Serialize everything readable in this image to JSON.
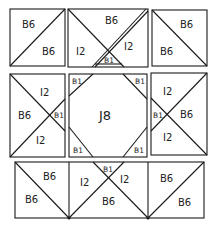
{
  "diagram": {
    "type": "quilt-block-layout",
    "rows": [
      {
        "name": "top-row",
        "blocks": [
          {
            "name": "top-left",
            "pieces": [
              {
                "label": "B6",
                "pos": "upper-left"
              },
              {
                "label": "B6",
                "pos": "lower-right"
              }
            ]
          },
          {
            "name": "top-center",
            "pieces": [
              {
                "label": "B6",
                "pos": "top"
              },
              {
                "label": "I2",
                "pos": "left"
              },
              {
                "label": "I2",
                "pos": "right"
              },
              {
                "label": "B1",
                "pos": "bottom"
              }
            ]
          },
          {
            "name": "top-right",
            "pieces": [
              {
                "label": "B6",
                "pos": "upper-right"
              },
              {
                "label": "B6",
                "pos": "lower-left"
              }
            ]
          }
        ]
      },
      {
        "name": "middle-row",
        "blocks": [
          {
            "name": "middle-left",
            "pieces": [
              {
                "label": "I2",
                "pos": "top"
              },
              {
                "label": "B6",
                "pos": "left"
              },
              {
                "label": "B1",
                "pos": "right"
              },
              {
                "label": "I2",
                "pos": "bottom"
              }
            ]
          },
          {
            "name": "center",
            "pieces": [
              {
                "label": "B1",
                "pos": "top-left"
              },
              {
                "label": "B1",
                "pos": "top-right"
              },
              {
                "label": "J8",
                "pos": "center"
              },
              {
                "label": "B1",
                "pos": "bottom-left"
              },
              {
                "label": "B1",
                "pos": "bottom-right"
              }
            ]
          },
          {
            "name": "middle-right",
            "pieces": [
              {
                "label": "I2",
                "pos": "top"
              },
              {
                "label": "B1",
                "pos": "left"
              },
              {
                "label": "B6",
                "pos": "right"
              },
              {
                "label": "I2",
                "pos": "bottom"
              }
            ]
          }
        ]
      },
      {
        "name": "bottom-row",
        "blocks": [
          {
            "name": "bottom-left",
            "pieces": [
              {
                "label": "B6",
                "pos": "upper-right"
              },
              {
                "label": "B6",
                "pos": "lower-left"
              }
            ]
          },
          {
            "name": "bottom-center",
            "pieces": [
              {
                "label": "B1",
                "pos": "top"
              },
              {
                "label": "I2",
                "pos": "left"
              },
              {
                "label": "I2",
                "pos": "right"
              },
              {
                "label": "B6",
                "pos": "bottom"
              }
            ]
          },
          {
            "name": "bottom-right",
            "pieces": [
              {
                "label": "B6",
                "pos": "upper-left"
              },
              {
                "label": "B6",
                "pos": "lower-right"
              }
            ]
          }
        ]
      }
    ]
  }
}
